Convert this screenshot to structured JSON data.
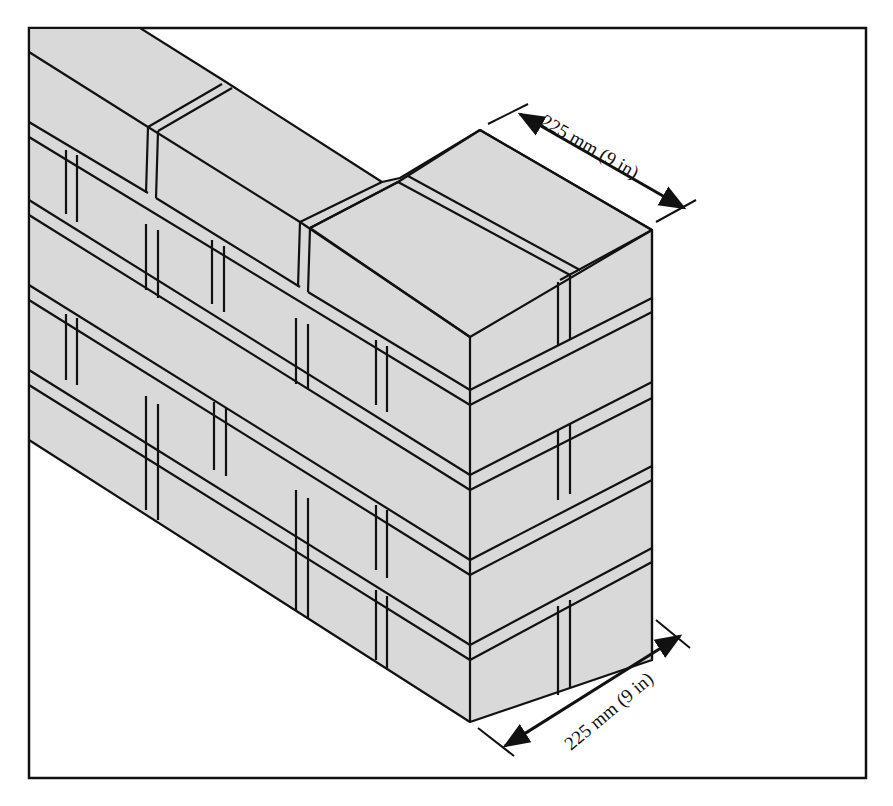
{
  "figure": {
    "colors": {
      "brick": "#d9d9d9",
      "outline": "#111111",
      "background": "#ffffff",
      "frame": "#111111"
    }
  },
  "dimensions": {
    "top": {
      "label": "225 mm (9 in)",
      "value_mm": 225,
      "value_in": 9
    },
    "bottom": {
      "label": "225 mm (9 in)",
      "value_mm": 225,
      "value_in": 9
    }
  }
}
